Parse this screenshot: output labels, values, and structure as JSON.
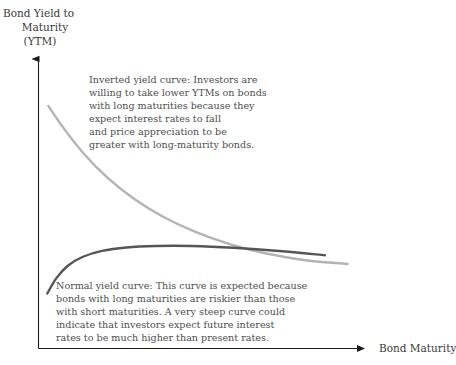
{
  "chart_data": {
    "type": "line",
    "title": "",
    "ylabel": "Bond Yield to Maturity (YTM)",
    "xlabel": "Bond Maturity",
    "grid": false,
    "legend": "annotations-inline",
    "axis_style": "arrow-axes-no-ticks",
    "xlim": [
      0,
      1
    ],
    "ylim": [
      0,
      1
    ],
    "series": [
      {
        "name": "Inverted yield curve",
        "color": "#b3b3b3",
        "points": [
          {
            "x": 0.03,
            "y": 0.838
          },
          {
            "x": 0.08,
            "y": 0.757
          },
          {
            "x": 0.14,
            "y": 0.672
          },
          {
            "x": 0.21,
            "y": 0.592
          },
          {
            "x": 0.29,
            "y": 0.52
          },
          {
            "x": 0.38,
            "y": 0.457
          },
          {
            "x": 0.48,
            "y": 0.404
          },
          {
            "x": 0.59,
            "y": 0.36
          },
          {
            "x": 0.7,
            "y": 0.328
          },
          {
            "x": 0.82,
            "y": 0.305
          },
          {
            "x": 0.95,
            "y": 0.292
          }
        ]
      },
      {
        "name": "Normal yield curve",
        "color": "#555555",
        "points": [
          {
            "x": 0.027,
            "y": 0.19
          },
          {
            "x": 0.055,
            "y": 0.243
          },
          {
            "x": 0.09,
            "y": 0.286
          },
          {
            "x": 0.135,
            "y": 0.316
          },
          {
            "x": 0.195,
            "y": 0.337
          },
          {
            "x": 0.27,
            "y": 0.349
          },
          {
            "x": 0.36,
            "y": 0.354
          },
          {
            "x": 0.47,
            "y": 0.354
          },
          {
            "x": 0.6,
            "y": 0.348
          },
          {
            "x": 0.74,
            "y": 0.337
          },
          {
            "x": 0.88,
            "y": 0.322
          }
        ]
      }
    ],
    "annotations": [
      {
        "id": "inverted",
        "text": "Inverted yield curve: Investors are willing to take lower YTMs on bonds with long maturities because they expect interest rates to fall and price appreciation to be greater with long-maturity bonds."
      },
      {
        "id": "normal",
        "text": "Normal yield curve: This curve is expected because bonds with long maturities are riskier than those with short maturities. A very steep curve could indicate that investors expect future interest rates to be much higher than present rates."
      }
    ]
  },
  "axes": {
    "y_title_lines": [
      "Bond Yield to",
      "Maturity",
      "(YTM)"
    ],
    "x_title": "Bond Maturity",
    "axis_color": "#1a1a1a"
  },
  "annotations": {
    "inverted": {
      "lines": [
        "Inverted yield curve: Investors are",
        "willing to take lower YTMs on bonds",
        "with long maturities because they",
        "expect interest rates to fall",
        "and price appreciation to be",
        "greater with long-maturity bonds."
      ]
    },
    "normal": {
      "lines": [
        "Normal yield curve: This curve is expected because",
        "bonds with long maturities are riskier than those",
        "with short maturities. A very steep curve could",
        "indicate that investors expect future interest",
        "rates to be much higher than present rates."
      ]
    }
  },
  "colors": {
    "inverted_curve": "#b3b3b3",
    "normal_curve": "#555555",
    "text": "#4d4d4d",
    "axis": "#1a1a1a",
    "background": "#ffffff"
  }
}
